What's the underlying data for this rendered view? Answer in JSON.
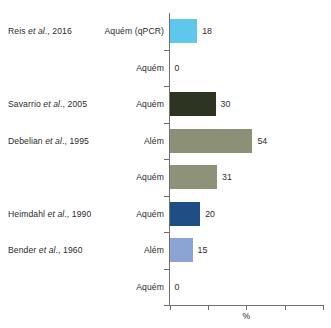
{
  "chart_data": {
    "type": "bar",
    "orientation": "horizontal",
    "title": "",
    "xlabel": "%",
    "ylabel": "",
    "xlim": [
      0,
      100
    ],
    "xticks": [
      0,
      25,
      50,
      75,
      100
    ],
    "xtick_labels": [
      "",
      "",
      "",
      "",
      ""
    ],
    "grid": false,
    "legend": false,
    "categories": [
      "Aquém (qPCR)",
      "Aquém",
      "Aquém",
      "Além",
      "Aquém",
      "Aquém",
      "Além",
      "Aquém"
    ],
    "values": [
      18,
      0,
      30,
      54,
      31,
      20,
      15,
      0
    ],
    "value_labels": [
      "18",
      "0",
      "30",
      "54",
      "31",
      "20",
      "15",
      "0"
    ],
    "bar_colors": [
      "#5FC7EC",
      "#ffffff",
      "#2D3522",
      "#8B9077",
      "#8D9279",
      "#1F4E85",
      "#8CA4D4",
      "#ffffff"
    ],
    "study_labels": [
      {
        "name": "Reis ",
        "italic": "et al",
        "suffix": "., 2016"
      },
      {
        "name": "",
        "italic": "",
        "suffix": ""
      },
      {
        "name": "Savarrio ",
        "italic": "et al",
        "suffix": "., 2005"
      },
      {
        "name": "Debelian ",
        "italic": "et al",
        "suffix": "., 1995"
      },
      {
        "name": "",
        "italic": "",
        "suffix": ""
      },
      {
        "name": "Heimdahl ",
        "italic": "et al",
        "suffix": "., 1990"
      },
      {
        "name": "Bender ",
        "italic": "et al",
        "suffix": "., 1960"
      },
      {
        "name": "",
        "italic": "",
        "suffix": ""
      }
    ]
  },
  "axis": {
    "x_title": "%",
    "line_color": "#6f6f6f"
  }
}
